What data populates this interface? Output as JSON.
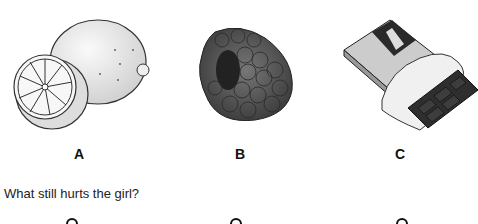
{
  "options": [
    {
      "letter": "A",
      "image": "lemon-icon"
    },
    {
      "letter": "B",
      "image": "raspberry-icon"
    },
    {
      "letter": "C",
      "image": "chocolate-bar-icon"
    }
  ],
  "question": "What still hurts the girl?"
}
